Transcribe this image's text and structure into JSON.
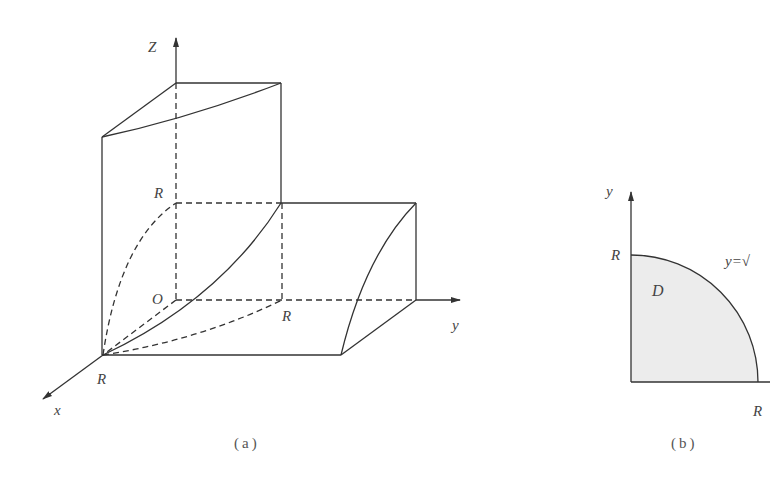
{
  "figure_a": {
    "caption": "(a)",
    "axis_labels": {
      "z": "Z",
      "y": "y",
      "x": "x",
      "origin": "O"
    },
    "tick_labels": {
      "z_R": "R",
      "y_R": "R",
      "x_R": "R"
    }
  },
  "figure_b": {
    "caption": "(b)",
    "axis_labels": {
      "y": "y"
    },
    "tick_labels": {
      "y_R": "R",
      "x_R": "R"
    },
    "region_label": "D",
    "curve_label": "y=√"
  },
  "colors": {
    "stroke": "#333333",
    "region_fill": "#ececec",
    "text": "#444444"
  }
}
